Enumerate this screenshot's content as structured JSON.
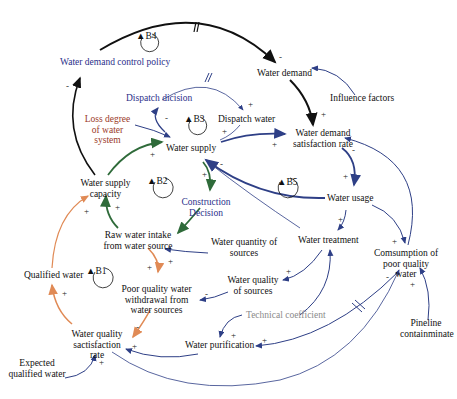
{
  "diagram": {
    "type": "causal-loop-diagram",
    "colors": {
      "black_link": "#111111",
      "blue_link": "#2e3f86",
      "green_link": "#2f6b3a",
      "orange_link": "#e08a55",
      "blue_label": "#2b2f8a",
      "red_label": "#9a3a2a",
      "gray_label": "#8a8a8a"
    },
    "nodes": {
      "water_demand_control_policy": "Water demand control policy",
      "dispatch_decision": "Dispatch dicision",
      "loss_degree": "Loss degree of water system",
      "water_supply": "Water supply",
      "dispatch_water": "Dispatch water",
      "water_demand": "Water demand",
      "influence_factors": "Influence factors",
      "water_demand_satisfaction_rate": "Water demand satisfaction rate",
      "water_supply_capacity": "Water supply capacity",
      "construction_decision": "Construction Decision",
      "water_usage": "Water usage",
      "raw_water_intake": "Raw water intake from water source",
      "water_quantity_of_sources": "Water quantity of sources",
      "water_treatment": "Water treatment",
      "consumption_poor_quality": "Comsumption of poor quality water",
      "qualified_water": "Qualified water",
      "water_quality_of_sources": "Water quality of sources",
      "poor_quality_withdrawal": "Poor quality water withdrawal from water sources",
      "technical_coefficient": "Technical coefficient",
      "pipeline_contaminate": "Pineline containminate",
      "water_quality_satisfaction_rate": "Water quality sactisfaction rate",
      "water_purification": "Water purification",
      "expected_qualified_water": "Expected qualified water"
    },
    "loops": [
      "B1",
      "B2",
      "B3",
      "B4",
      "B5"
    ],
    "signs": {
      "plus": "+",
      "minus": "-"
    }
  }
}
